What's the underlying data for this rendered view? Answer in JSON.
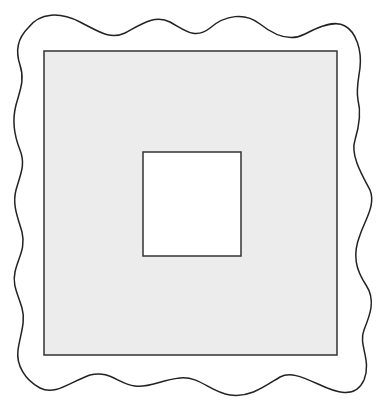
{
  "diagram": {
    "colors": {
      "background": "#ffffff",
      "stroke": "#333333",
      "outer_fill": "#ececec",
      "inner_fill": "#ffffff"
    },
    "outer_rect": {
      "x": 44,
      "y": 51,
      "width": 293,
      "height": 304
    },
    "inner_rect": {
      "x": 143,
      "y": 152,
      "width": 98,
      "height": 104
    }
  }
}
